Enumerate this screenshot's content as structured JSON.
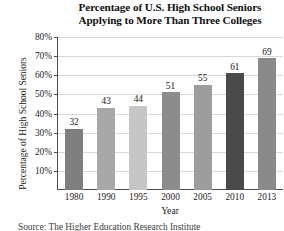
{
  "chart_data": {
    "type": "bar",
    "title": "Percentage of U.S. High School Seniors Applying to More Than Three Colleges",
    "title_lines": [
      "Percentage of U.S. High School Seniors",
      "Applying to More Than Three Colleges"
    ],
    "xlabel": "Year",
    "ylabel": "Percentage of High School Seniors",
    "categories": [
      "1980",
      "1990",
      "1995",
      "2000",
      "2005",
      "2010",
      "2013"
    ],
    "values": [
      32,
      43,
      44,
      51,
      55,
      61,
      69
    ],
    "value_labels": [
      "32",
      "43",
      "44",
      "51",
      "55",
      "61",
      "69"
    ],
    "bar_colors": [
      "#7f7f7f",
      "#a8a8a8",
      "#c6c6c6",
      "#8c8c8c",
      "#9d9d9d",
      "#4a4a4a",
      "#8a8a8a"
    ],
    "ylim": [
      0,
      80
    ],
    "yticks": [
      10,
      20,
      30,
      40,
      50,
      60,
      70,
      80
    ],
    "ytick_labels": [
      "10%",
      "20%",
      "30%",
      "40%",
      "50%",
      "60%",
      "70%",
      "80%"
    ],
    "grid": true,
    "grid_axis": "y",
    "legend": "none",
    "axis_color": "#4d4d4d",
    "grid_color": "#d8d8d8"
  },
  "footer": {
    "source_note": "Source: The Higher Education Research Institute"
  }
}
